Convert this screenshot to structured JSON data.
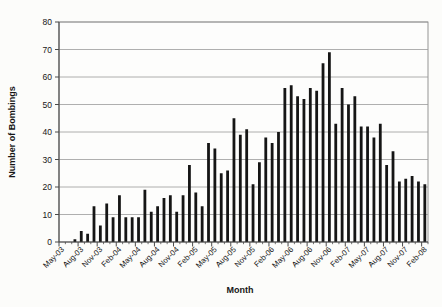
{
  "page": {
    "background": "#fcfcfa"
  },
  "chart_data": {
    "type": "bar",
    "title": "",
    "xlabel": "Month",
    "ylabel": "Number of Bombings",
    "ylim": [
      0,
      80
    ],
    "ytick_interval": 10,
    "yticks": [
      0,
      10,
      20,
      30,
      40,
      50,
      60,
      70,
      80
    ],
    "xtick_label_interval": 3,
    "grid": "horizontal",
    "legend": "none",
    "bar_color": "#151515",
    "gridline_color": "#9a9a9a",
    "axis_color": "#4a4a4a",
    "plot_border_color": "#7a7a7a",
    "plot_bg": "#fdfdfc",
    "categories": [
      "May-03",
      "Jun-03",
      "Jul-03",
      "Aug-03",
      "Sep-03",
      "Oct-03",
      "Nov-03",
      "Dec-03",
      "Jan-04",
      "Feb-04",
      "Mar-04",
      "Apr-04",
      "May-04",
      "Jun-04",
      "Jul-04",
      "Aug-04",
      "Sep-04",
      "Oct-04",
      "Nov-04",
      "Dec-04",
      "Jan-05",
      "Feb-05",
      "Mar-05",
      "Apr-05",
      "May-05",
      "Jun-05",
      "Jul-05",
      "Aug-05",
      "Sep-05",
      "Oct-05",
      "Nov-05",
      "Dec-05",
      "Jan-06",
      "Feb-06",
      "Mar-06",
      "Apr-06",
      "May-06",
      "Jun-06",
      "Jul-06",
      "Aug-06",
      "Sep-06",
      "Oct-06",
      "Nov-06",
      "Dec-06",
      "Jan-07",
      "Feb-07",
      "Mar-07",
      "Apr-07",
      "May-07",
      "Jun-07",
      "Jul-07",
      "Aug-07",
      "Sep-07",
      "Oct-07",
      "Nov-07",
      "Dec-07",
      "Jan-08",
      "Feb-08"
    ],
    "values": [
      0,
      0,
      1,
      4,
      3,
      13,
      6,
      14,
      9,
      17,
      9,
      9,
      9,
      19,
      11,
      13,
      16,
      17,
      11,
      17,
      28,
      18,
      13,
      36,
      34,
      25,
      26,
      45,
      39,
      41,
      21,
      29,
      38,
      36,
      40,
      56,
      57,
      53,
      52,
      56,
      55,
      65,
      69,
      43,
      56,
      50,
      53,
      42,
      42,
      38,
      43,
      28,
      33,
      22,
      23,
      24,
      22,
      21
    ]
  }
}
